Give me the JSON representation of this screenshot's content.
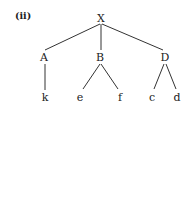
{
  "diagram": {
    "type": "tree",
    "caption": "(ii)",
    "root": "X",
    "nodes": {
      "X": {
        "label": "X",
        "x": 101,
        "y": 18
      },
      "A": {
        "label": "A",
        "x": 44,
        "y": 57
      },
      "B": {
        "label": "B",
        "x": 100,
        "y": 57
      },
      "D": {
        "label": "D",
        "x": 165,
        "y": 57
      },
      "k": {
        "label": "k",
        "x": 45,
        "y": 97
      },
      "e": {
        "label": "e",
        "x": 80,
        "y": 97
      },
      "f": {
        "label": "f",
        "x": 120,
        "y": 97
      },
      "c": {
        "label": "c",
        "x": 152,
        "y": 97
      },
      "d": {
        "label": "d",
        "x": 177,
        "y": 97
      }
    },
    "edges": [
      [
        "X",
        "A"
      ],
      [
        "X",
        "B"
      ],
      [
        "X",
        "D"
      ],
      [
        "A",
        "k"
      ],
      [
        "B",
        "e"
      ],
      [
        "B",
        "f"
      ],
      [
        "D",
        "c"
      ],
      [
        "D",
        "d"
      ]
    ],
    "children": {
      "X": [
        "A",
        "B",
        "D"
      ],
      "A": [
        "k"
      ],
      "B": [
        "e",
        "f"
      ],
      "D": [
        "c",
        "d"
      ]
    }
  }
}
